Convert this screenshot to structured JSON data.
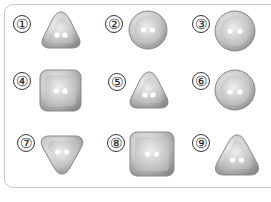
{
  "colors": {
    "frame": "#c8c8c8",
    "button_light": "#e4e4e4",
    "button_mid": "#bdbdbd",
    "button_dark": "#8c8c8c",
    "hole": "#ffffff"
  },
  "buttons": [
    {
      "label": "①",
      "shape": "triangle",
      "holes": 2
    },
    {
      "label": "②",
      "shape": "circle",
      "holes": 2
    },
    {
      "label": "③",
      "shape": "circle",
      "holes": 2
    },
    {
      "label": "④",
      "shape": "square",
      "holes": 2
    },
    {
      "label": "⑤",
      "shape": "triangle",
      "holes": 2
    },
    {
      "label": "⑥",
      "shape": "circle",
      "holes": 2
    },
    {
      "label": "⑦",
      "shape": "triangle-inverted",
      "holes": 2
    },
    {
      "label": "⑧",
      "shape": "square",
      "holes": 2
    },
    {
      "label": "⑨",
      "shape": "triangle",
      "holes": 2
    }
  ]
}
